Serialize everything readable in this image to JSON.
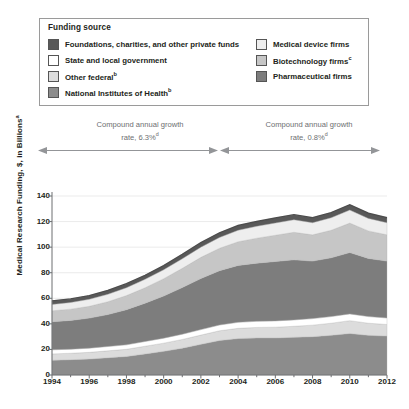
{
  "legend": {
    "title": "Funding source",
    "left_items": [
      {
        "label": "Foundations, charities, and other private funds",
        "sup": "",
        "color": "#595959"
      },
      {
        "label": "State and local government",
        "sup": "",
        "color": "#ffffff"
      },
      {
        "label": "Other federal",
        "sup": "b",
        "color": "#dcdcdc"
      },
      {
        "label": "National Institutes of Health",
        "sup": "b",
        "color": "#8c8c8c"
      }
    ],
    "right_items": [
      {
        "label": "Medical device firms",
        "sup": "",
        "color": "#eeeeee"
      },
      {
        "label": "Biotechnology firms",
        "sup": "c",
        "color": "#c6c6c6"
      },
      {
        "label": "Pharmaceutical firms",
        "sup": "",
        "color": "#7d7d7d"
      }
    ]
  },
  "annotations": {
    "left": {
      "line1": "Compound annual growth",
      "line2": "rate, 6.3%",
      "sup": "d"
    },
    "right": {
      "line1": "Compound annual growth",
      "line2": "rate, 0.8%",
      "sup": "d"
    }
  },
  "chart_data": {
    "type": "area",
    "title": "",
    "xlabel": "",
    "ylabel": "Medical Research Funding, $, in Billions",
    "ylabel_sup": "a",
    "xlim": [
      1994,
      2012
    ],
    "ylim": [
      0,
      140
    ],
    "yticks": [
      0,
      20,
      40,
      60,
      80,
      100,
      120,
      140
    ],
    "xticks": [
      1994,
      1996,
      1998,
      2000,
      2002,
      2004,
      2006,
      2008,
      2010,
      2012
    ],
    "x": [
      1994,
      1995,
      1996,
      1997,
      1998,
      1999,
      2000,
      2001,
      2002,
      2003,
      2004,
      2005,
      2006,
      2007,
      2008,
      2009,
      2010,
      2011,
      2012
    ],
    "grid": true,
    "legend_position": "top",
    "stack_order_bottom_to_top": [
      "National Institutes of Health",
      "Other federal",
      "State and local government",
      "Pharmaceutical firms",
      "Biotechnology firms",
      "Medical device firms",
      "Foundations, charities, and other private funds"
    ],
    "series": [
      {
        "name": "National Institutes of Health",
        "color": "#8c8c8c",
        "values": [
          11.5,
          12.0,
          12.5,
          13.5,
          14.5,
          16.5,
          18.5,
          21.0,
          24.0,
          27.0,
          28.5,
          29.0,
          29.0,
          29.5,
          30.0,
          31.0,
          32.5,
          31.0,
          30.5
        ]
      },
      {
        "name": "Other federal",
        "color": "#dcdcdc",
        "values": [
          5.0,
          5.0,
          5.2,
          5.4,
          5.6,
          6.0,
          6.4,
          6.8,
          7.2,
          7.6,
          8.0,
          8.2,
          8.4,
          8.6,
          9.0,
          9.5,
          10.0,
          9.5,
          9.0
        ]
      },
      {
        "name": "State and local government",
        "color": "#ffffff",
        "values": [
          3.2,
          3.2,
          3.3,
          3.4,
          3.5,
          3.7,
          3.9,
          4.1,
          4.3,
          4.5,
          4.7,
          4.8,
          4.9,
          5.0,
          5.1,
          5.2,
          5.3,
          5.2,
          5.1
        ]
      },
      {
        "name": "Pharmaceutical firms",
        "color": "#7d7d7d",
        "values": [
          22.0,
          22.5,
          23.5,
          25.0,
          27.5,
          30.0,
          33.0,
          36.5,
          40.0,
          42.5,
          44.5,
          45.5,
          46.5,
          47.0,
          45.0,
          46.0,
          48.0,
          45.5,
          44.5
        ]
      },
      {
        "name": "Biotechnology firms",
        "color": "#c6c6c6",
        "values": [
          8.5,
          8.8,
          9.2,
          10.0,
          11.0,
          12.0,
          13.5,
          15.0,
          16.5,
          17.5,
          18.5,
          19.5,
          20.5,
          21.5,
          20.5,
          21.5,
          23.0,
          21.5,
          20.5
        ]
      },
      {
        "name": "Medical device firms",
        "color": "#eeeeee",
        "values": [
          5.0,
          5.2,
          5.5,
          5.8,
          6.2,
          6.6,
          7.0,
          7.5,
          8.0,
          8.5,
          9.0,
          9.3,
          9.6,
          9.8,
          9.5,
          9.8,
          10.2,
          9.8,
          9.5
        ]
      },
      {
        "name": "Foundations, charities, and other private funds",
        "color": "#595959",
        "values": [
          2.8,
          2.8,
          2.9,
          3.0,
          3.1,
          3.2,
          3.3,
          3.4,
          3.5,
          3.6,
          3.7,
          3.8,
          3.9,
          4.0,
          3.9,
          4.0,
          4.1,
          4.0,
          3.9
        ]
      }
    ],
    "totals": [
      58.0,
      59.5,
      62.1,
      66.1,
      71.4,
      78.0,
      85.6,
      94.3,
      103.5,
      111.2,
      116.9,
      120.1,
      122.8,
      125.4,
      123.0,
      127.0,
      133.1,
      126.5,
      123.0
    ]
  }
}
